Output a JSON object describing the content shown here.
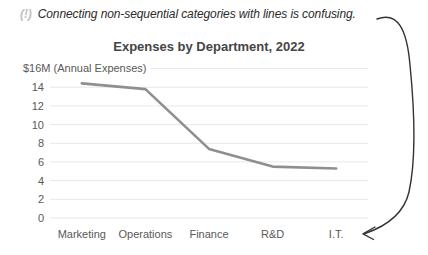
{
  "annotation": {
    "icon": "(!)",
    "text": "Connecting non-sequential categories with lines is confusing."
  },
  "chart_data": {
    "type": "line",
    "title": "Expenses by Department, 2022",
    "y_axis_top_label": "$16M (Annual Expenses)",
    "xlabel": "",
    "ylabel": "Annual Expenses ($M)",
    "categories": [
      "Marketing",
      "Operations",
      "Finance",
      "R&D",
      "I.T."
    ],
    "series": [
      {
        "name": "Annual Expenses",
        "values": [
          14.4,
          13.8,
          7.4,
          5.5,
          5.3
        ]
      }
    ],
    "ylim": [
      0,
      16
    ],
    "ytick_step": 2,
    "ytick_labels": [
      "0",
      "2",
      "4",
      "6",
      "8",
      "10",
      "12",
      "14"
    ],
    "grid": true,
    "legend_position": "none",
    "colors": {
      "line": "#8f8f8f",
      "gridline": "#e8e8e8",
      "axis_text": "#595959",
      "title": "#454545",
      "annotation_text": "#2b2b2b",
      "annotation_icon": "#c2c0bc",
      "arrow": "#333333"
    }
  }
}
